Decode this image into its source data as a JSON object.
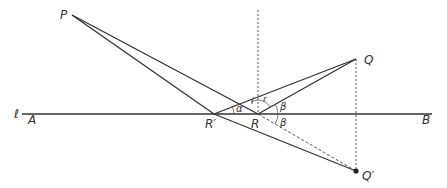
{
  "diagram": {
    "type": "reflection-geometry",
    "colors": {
      "line": "#333333",
      "dashed": "#555555",
      "background": "#ffffff"
    },
    "points": {
      "P": {
        "label": "P",
        "x": 72,
        "y": 15
      },
      "Q": {
        "label": "Q",
        "x": 356,
        "y": 59
      },
      "Q_prime": {
        "label": "Q′",
        "x": 356,
        "y": 171
      },
      "R": {
        "label": "R",
        "x": 258,
        "y": 114
      },
      "R_prime": {
        "label": "R′",
        "x": 214,
        "y": 114
      }
    },
    "line": {
      "label": "ℓ",
      "start_label": "A",
      "end_label": "B"
    },
    "angles": {
      "alpha": "α",
      "i": "i",
      "r": "r",
      "beta_top": "β",
      "beta_bottom": "β"
    }
  }
}
